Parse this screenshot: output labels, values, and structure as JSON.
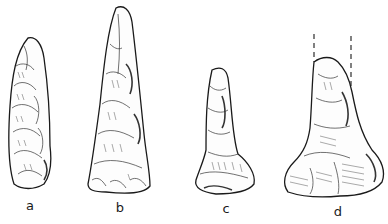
{
  "figure": {
    "items": [
      {
        "id": "a",
        "label": "a",
        "shape": "elongated blade, rounded ends"
      },
      {
        "id": "b",
        "label": "b",
        "shape": "long tapered point, wide base"
      },
      {
        "id": "c",
        "label": "c",
        "shape": "short drill-like point, flared base"
      },
      {
        "id": "d",
        "label": "d",
        "shape": "broken point with dashed projection lines, flared base"
      }
    ],
    "colors": {
      "ink": "#1a1a1a",
      "background": "#ffffff"
    }
  }
}
